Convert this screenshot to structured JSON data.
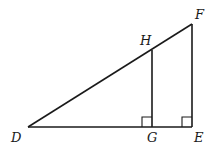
{
  "diagram": {
    "type": "geometry",
    "points": {
      "D": {
        "label": "D",
        "x": 28,
        "y": 127
      },
      "G": {
        "label": "G",
        "x": 152,
        "y": 127
      },
      "E": {
        "label": "E",
        "x": 192,
        "y": 127
      },
      "F": {
        "label": "F",
        "x": 192,
        "y": 24
      },
      "H": {
        "label": "H",
        "x": 152,
        "y": 50
      }
    },
    "segments": [
      "DE",
      "DF",
      "FE",
      "HG"
    ],
    "right_angles": [
      "G",
      "E"
    ],
    "stroke_color": "#1a1a1a"
  }
}
